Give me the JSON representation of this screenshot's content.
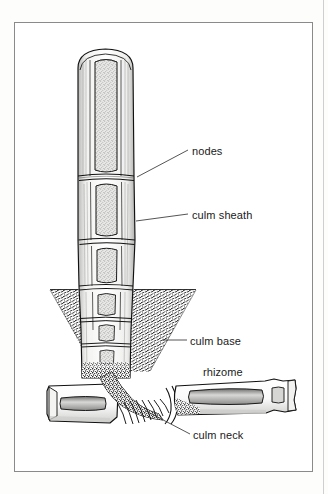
{
  "figure": {
    "kind": "botanical-line-drawing",
    "style": "black-and-white stippled pen illustration",
    "frame": {
      "border_color": "#8a8a8a",
      "background": "#ffffff"
    },
    "ink_color": "#111111",
    "soil_color": "#2a2a2a"
  },
  "labels": [
    {
      "id": "nodes",
      "text": "nodes"
    },
    {
      "id": "culm_sheath",
      "text": "culm sheath"
    },
    {
      "id": "culm_base",
      "text": "culm base"
    },
    {
      "id": "rhizome",
      "text": "rhizome"
    },
    {
      "id": "culm_neck",
      "text": "culm neck"
    }
  ],
  "leader_lines": [
    {
      "for": "nodes",
      "from_x": 188,
      "from_y": 150,
      "to_x": 137,
      "to_y": 177
    },
    {
      "for": "culm_sheath",
      "from_x": 188,
      "from_y": 214,
      "to_x": 136,
      "to_y": 221
    },
    {
      "for": "culm_base",
      "from_x": 187,
      "from_y": 340,
      "to_x": 162,
      "to_y": 340
    },
    {
      "for": "culm_neck",
      "from_x": 190,
      "from_y": 434,
      "to_x": 146,
      "to_y": 411
    }
  ]
}
